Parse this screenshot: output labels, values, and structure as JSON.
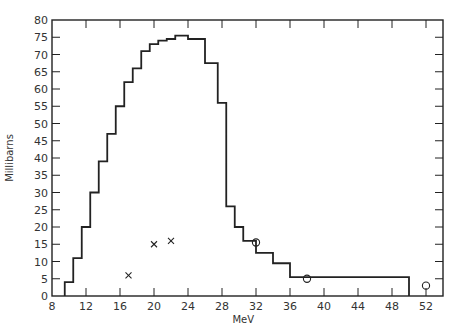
{
  "chart_data": {
    "type": "line",
    "title": "",
    "xlabel": "MeV",
    "ylabel": "Millibarns",
    "xlim": [
      8,
      54
    ],
    "ylim": [
      0,
      80
    ],
    "grid": false,
    "x_ticks": [
      8,
      12,
      16,
      20,
      24,
      28,
      32,
      36,
      40,
      44,
      48,
      52
    ],
    "y_ticks": [
      0,
      5,
      10,
      15,
      20,
      25,
      30,
      35,
      40,
      45,
      50,
      55,
      60,
      65,
      70,
      75,
      80
    ],
    "series": [
      {
        "name": "histogram",
        "style": "step",
        "bins": [
          {
            "x0": 9.5,
            "x1": 10.5,
            "y": 4
          },
          {
            "x0": 10.5,
            "x1": 11.5,
            "y": 11
          },
          {
            "x0": 11.5,
            "x1": 12.5,
            "y": 20
          },
          {
            "x0": 12.5,
            "x1": 13.5,
            "y": 30
          },
          {
            "x0": 13.5,
            "x1": 14.5,
            "y": 39
          },
          {
            "x0": 14.5,
            "x1": 15.5,
            "y": 47
          },
          {
            "x0": 15.5,
            "x1": 16.5,
            "y": 55
          },
          {
            "x0": 16.5,
            "x1": 17.5,
            "y": 62
          },
          {
            "x0": 17.5,
            "x1": 18.5,
            "y": 66
          },
          {
            "x0": 18.5,
            "x1": 19.5,
            "y": 71
          },
          {
            "x0": 19.5,
            "x1": 20.5,
            "y": 73
          },
          {
            "x0": 20.5,
            "x1": 21.5,
            "y": 74
          },
          {
            "x0": 21.5,
            "x1": 22.5,
            "y": 74.5
          },
          {
            "x0": 22.5,
            "x1": 24,
            "y": 75.5
          },
          {
            "x0": 24,
            "x1": 26,
            "y": 74.5
          },
          {
            "x0": 26,
            "x1": 27.5,
            "y": 67.5
          },
          {
            "x0": 27.5,
            "x1": 28.5,
            "y": 56
          },
          {
            "x0": 28.5,
            "x1": 29.5,
            "y": 26
          },
          {
            "x0": 29.5,
            "x1": 30.5,
            "y": 20
          },
          {
            "x0": 30.5,
            "x1": 32,
            "y": 16
          },
          {
            "x0": 32,
            "x1": 34,
            "y": 12.5
          },
          {
            "x0": 34,
            "x1": 36,
            "y": 9.5
          },
          {
            "x0": 36,
            "x1": 50,
            "y": 5.5
          }
        ]
      },
      {
        "name": "crosses",
        "style": "scatter",
        "marker": "x",
        "points": [
          [
            17,
            6
          ],
          [
            20,
            15
          ],
          [
            22,
            16
          ]
        ]
      },
      {
        "name": "circles",
        "style": "scatter",
        "marker": "o",
        "points": [
          [
            32,
            15.5
          ],
          [
            38,
            5
          ],
          [
            52,
            3
          ]
        ]
      }
    ]
  }
}
